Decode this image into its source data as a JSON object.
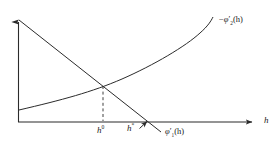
{
  "figure": {
    "background_color": "#ffffff",
    "line_color": "#2b2b2b",
    "text_color": "#1a1a1a",
    "axes": {
      "x_axis_label": "h",
      "y_axis_label": "",
      "origin": {
        "x": 18,
        "y": 122
      },
      "x_axis_end": {
        "x": 258,
        "y": 122
      },
      "y_axis_top": {
        "x": 18,
        "y": 16
      }
    },
    "labels": {
      "h_axis": "h",
      "h_zero": "h",
      "h_zero_sup": "0",
      "h_star": "h",
      "h_star_sup": "*",
      "phi1_minus": "",
      "phi1_symbol": "φ",
      "phi1_prime": "′",
      "phi1_sub": "1",
      "phi1_arg": "(h)",
      "phi2_minus": "−",
      "phi2_symbol": "φ",
      "phi2_prime": "′",
      "phi2_sub": "2",
      "phi2_arg": "(h)"
    },
    "curves": [
      {
        "name": "phi1-prime-line",
        "description": "downward sloping straight line labelled phi'_1(h)",
        "type": "line",
        "points": [
          [
            19,
            20
          ],
          [
            103,
            86
          ],
          [
            148,
            122
          ],
          [
            161,
            132
          ]
        ]
      },
      {
        "name": "minus-phi2-prime-curve",
        "description": "upward sloping convex curve labelled -phi'_2(h)",
        "type": "curve",
        "points": [
          [
            19,
            110
          ],
          [
            60,
            99
          ],
          [
            103,
            86
          ],
          [
            150,
            66
          ],
          [
            185,
            45
          ],
          [
            205,
            28
          ],
          [
            213,
            17
          ]
        ]
      }
    ],
    "guide_lines": [
      {
        "name": "h0-dashed-drop",
        "type": "dashed-vertical",
        "from": [
          103,
          86
        ],
        "to": [
          103,
          122
        ]
      }
    ],
    "annotations": [
      {
        "name": "h-star-pointer",
        "type": "arrow",
        "from": [
          140,
          128
        ],
        "to": [
          149,
          120
        ]
      }
    ],
    "intersection_point": {
      "x": 103,
      "y": 86
    }
  }
}
